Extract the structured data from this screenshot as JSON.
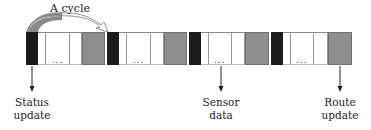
{
  "diagram": {
    "cycle_label": "A cycle",
    "cell_types": [
      "black",
      "white",
      "white",
      "white",
      "gray"
    ],
    "ellipsis": "...",
    "cells": [
      {
        "type": "black",
        "x": 26,
        "w": 12
      },
      {
        "type": "white",
        "x": 38,
        "w": 8
      },
      {
        "type": "white",
        "x": 46,
        "w": 24,
        "dots": true
      },
      {
        "type": "white",
        "x": 70,
        "w": 12
      },
      {
        "type": "gray",
        "x": 82,
        "w": 23
      },
      {
        "type": "black",
        "x": 107,
        "w": 12
      },
      {
        "type": "white",
        "x": 119,
        "w": 8
      },
      {
        "type": "white",
        "x": 127,
        "w": 24,
        "dots": true
      },
      {
        "type": "white",
        "x": 151,
        "w": 13
      },
      {
        "type": "gray",
        "x": 164,
        "w": 23
      },
      {
        "type": "black",
        "x": 189,
        "w": 12
      },
      {
        "type": "white",
        "x": 201,
        "w": 8
      },
      {
        "type": "white",
        "x": 209,
        "w": 23,
        "dots": true
      },
      {
        "type": "white",
        "x": 232,
        "w": 13
      },
      {
        "type": "gray",
        "x": 245,
        "w": 24
      },
      {
        "type": "black",
        "x": 271,
        "w": 12
      },
      {
        "type": "white",
        "x": 283,
        "w": 8
      },
      {
        "type": "white",
        "x": 291,
        "w": 23,
        "dots": true
      },
      {
        "type": "white",
        "x": 314,
        "w": 14
      },
      {
        "type": "gray",
        "x": 328,
        "w": 24
      }
    ],
    "annotations": [
      {
        "line1": "Status",
        "line2": "update",
        "x": 32,
        "points_to": "black cell"
      },
      {
        "line1": "Sensor",
        "line2": "data",
        "x": 221,
        "points_to": "white cell (dots)"
      },
      {
        "line1": "Route",
        "line2": "update",
        "x": 340,
        "points_to": "gray cell"
      }
    ],
    "colors": {
      "black_cell": "#1c1c1c",
      "gray_cell": "#8e8e8e",
      "white_cell": "#ffffff",
      "arc_fill": "#8a8a8a"
    }
  }
}
